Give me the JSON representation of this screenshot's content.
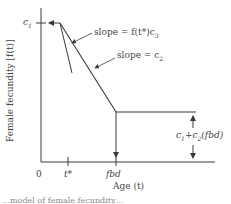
{
  "diagram": {
    "y_axis_label": "Female fecundity [f(t)]",
    "x_axis_label": "Age (t)",
    "y_tick_label": "c",
    "y_tick_sub": "1",
    "x_ticks": [
      "0",
      "t*",
      "fbd"
    ],
    "annotations": {
      "slope1": "slope = f(t*)c",
      "slope1_sub": "3",
      "slope2": "slope = c",
      "slope2_sub": "2",
      "plateau": "c",
      "plateau_sub1": "1",
      "plateau_mid": "+c",
      "plateau_sub2": "2",
      "plateau_tail": "(fbd)"
    },
    "caption": "…model of female fecundity…"
  },
  "colors": {
    "line": "#3a3a3a",
    "text": "#444444"
  }
}
